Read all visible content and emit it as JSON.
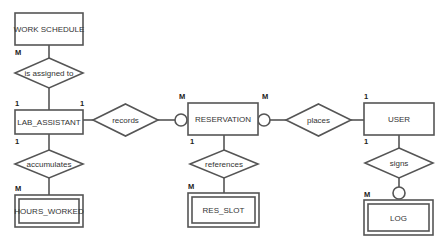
{
  "diagram": {
    "type": "entity-relationship",
    "entities": [
      {
        "id": "work_schedule",
        "label": "WORK SCHEDULE",
        "weak": false
      },
      {
        "id": "lab_assistant",
        "label": "LAB_ASSISTANT",
        "weak": false
      },
      {
        "id": "hours_worked",
        "label": "HOURS_WORKED",
        "weak": true
      },
      {
        "id": "reservation",
        "label": "RESERVATION",
        "weak": false
      },
      {
        "id": "res_slot",
        "label": "RES_SLOT",
        "weak": true
      },
      {
        "id": "user",
        "label": "USER",
        "weak": false
      },
      {
        "id": "log",
        "label": "LOG",
        "weak": true
      }
    ],
    "relationships": [
      {
        "id": "is_assigned_to",
        "label": "is assigned to",
        "from": "lab_assistant",
        "to": "work_schedule",
        "from_card": "1",
        "to_card": "M"
      },
      {
        "id": "accumulates",
        "label": "accumulates",
        "from": "lab_assistant",
        "to": "hours_worked",
        "from_card": "1",
        "to_card": "M"
      },
      {
        "id": "records",
        "label": "records",
        "from": "lab_assistant",
        "to": "reservation",
        "from_card": "1",
        "to_card": "M",
        "optional_side": "reservation"
      },
      {
        "id": "references",
        "label": "references",
        "from": "reservation",
        "to": "res_slot",
        "from_card": "1",
        "to_card": "M"
      },
      {
        "id": "places",
        "label": "places",
        "from": "user",
        "to": "reservation",
        "from_card": "1",
        "to_card": "M",
        "optional_side": "reservation"
      },
      {
        "id": "signs",
        "label": "signs",
        "from": "user",
        "to": "log",
        "from_card": "1",
        "to_card": "M",
        "optional_side": "log"
      }
    ],
    "cardinalities": {
      "work_schedule_bottom": "M",
      "lab_assistant_top_left": "1",
      "lab_assistant_top_right": "1",
      "lab_assistant_bottom": "1",
      "hours_worked_top": "M",
      "reservation_top_left": "M",
      "reservation_top_right": "M",
      "reservation_bottom": "1",
      "res_slot_top": "M",
      "user_top": "1",
      "user_bottom": "1",
      "log_top": "M"
    },
    "colors": {
      "stroke": "#555555",
      "text": "#333333",
      "background": "#ffffff"
    }
  }
}
